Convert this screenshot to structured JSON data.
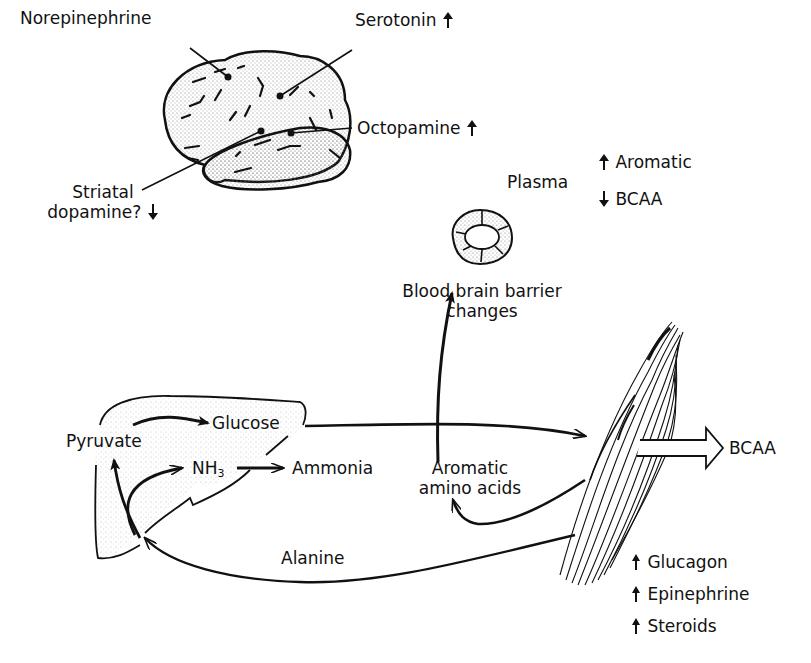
{
  "brain": {
    "labels": {
      "norepinephrine": "Norepinephrine",
      "serotonin": "Serotonin",
      "octopamine": "Octopamine",
      "striatal_dopamine_line1": "Striatal",
      "striatal_dopamine_line2": "dopamine?"
    },
    "changes": {
      "serotonin": "up",
      "octopamine": "up",
      "striatal_dopamine": "down"
    }
  },
  "plasma": {
    "label": "Plasma",
    "items": [
      {
        "name": "Aromatic",
        "direction": "up"
      },
      {
        "name": "BCAA",
        "direction": "down"
      }
    ]
  },
  "blood_brain_barrier": {
    "line1": "Blood brain barrier",
    "line2": "changes"
  },
  "liver": {
    "pyruvate": "Pyruvate",
    "glucose": "Glucose",
    "nh3": "NH",
    "nh3_subscript": "3",
    "ammonia": "Ammonia"
  },
  "aromatic_amino_acids": {
    "line1": "Aromatic",
    "line2": "amino acids"
  },
  "alanine": "Alanine",
  "muscle_output": "BCAA",
  "hormones": [
    {
      "name": "Glucagon",
      "direction": "up"
    },
    {
      "name": "Epinephrine",
      "direction": "up"
    },
    {
      "name": "Steroids",
      "direction": "up"
    }
  ]
}
